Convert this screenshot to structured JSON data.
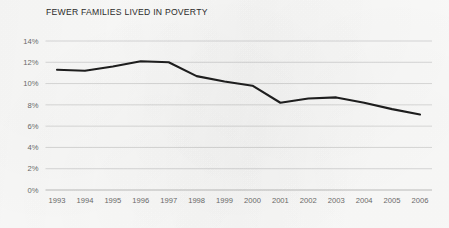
{
  "chart_data": {
    "type": "line",
    "title": "FEWER FAMILIES LIVED IN POVERTY",
    "xlabel": "",
    "ylabel": "",
    "categories": [
      "1993",
      "1994",
      "1995",
      "1996",
      "1997",
      "1998",
      "1999",
      "2000",
      "2001",
      "2002",
      "2003",
      "2004",
      "2005",
      "2006"
    ],
    "values": [
      11.3,
      11.2,
      11.6,
      12.1,
      12.0,
      10.7,
      10.2,
      9.8,
      8.2,
      8.6,
      8.7,
      8.2,
      7.6,
      7.1
    ],
    "ylim": [
      0,
      14
    ],
    "ytick_labels": [
      "14%",
      "12%",
      "10%",
      "8%",
      "6%",
      "4%",
      "2%",
      "0%"
    ],
    "ytick_values": [
      14,
      12,
      10,
      8,
      6,
      4,
      2,
      0
    ],
    "grid": true,
    "legend": "none",
    "series_color": "#1e1e1e",
    "grid_color": "#c8c8c8",
    "axis_text_color": "#6b6b6b",
    "title_color": "#2c2c2c",
    "background_color": "#fbfbfa"
  }
}
